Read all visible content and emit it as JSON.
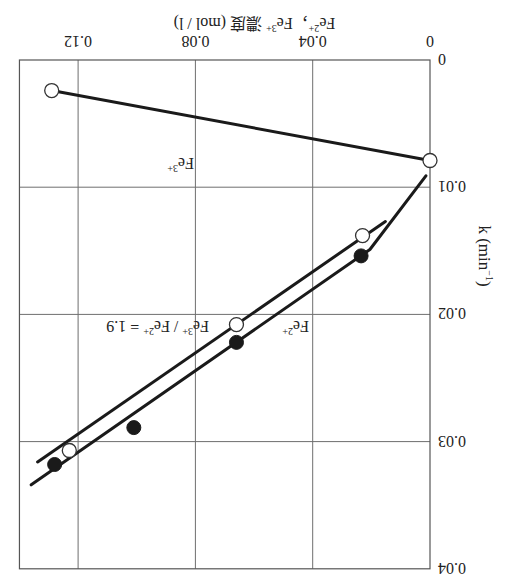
{
  "orientation": "rotated-180",
  "chart_data": {
    "type": "line",
    "title": "",
    "xlabel": "Fe2+, Fe3+ 濃度 (mol / l)",
    "ylabel": "k (min⁻¹)",
    "xlim": [
      0,
      0.14
    ],
    "ylim": [
      0,
      0.04
    ],
    "x_ticks": [
      "0",
      "0.04",
      "0.08",
      "0.12"
    ],
    "y_ticks": [
      "0",
      "0.01",
      "0.02",
      "0.03",
      "0.04"
    ],
    "grid": true,
    "series": [
      {
        "name": "Fe3+",
        "marker": "open-circle",
        "points": [
          [
            0,
            0.0079
          ],
          [
            0.129,
            0.0024
          ]
        ],
        "line": [
          [
            0,
            0.0079
          ],
          [
            0.129,
            0.0024
          ]
        ]
      },
      {
        "name": "Fe2+",
        "marker": "filled-circle",
        "points": [
          [
            0.0235,
            0.0154
          ],
          [
            0.066,
            0.0222
          ],
          [
            0.101,
            0.0289
          ],
          [
            0.128,
            0.0318
          ]
        ],
        "line": [
          [
            0.0014,
            0.0091
          ],
          [
            0.0205,
            0.0149
          ],
          [
            0.136,
            0.0334
          ]
        ]
      },
      {
        "name": "Fe3+ / Fe2+ = 1.9",
        "marker": "open-circle",
        "points": [
          [
            0.023,
            0.0138
          ],
          [
            0.066,
            0.0208
          ],
          [
            0.123,
            0.0307
          ]
        ],
        "line": [
          [
            0.0152,
            0.0127
          ],
          [
            0.1338,
            0.0316
          ]
        ]
      }
    ]
  },
  "labels": {
    "x_title_main": "Fe",
    "x_title_sup1": "2+",
    "x_title_sep": "，",
    "x_title_fe": "Fe",
    "x_title_sup2": "3+",
    "x_title_rest": " 濃度 (mol / l)",
    "y_title": "k (min",
    "y_title_sup": "−1",
    "y_title_close": ")",
    "fe3_label": "Fe",
    "fe3_sup": "3+",
    "fe2_label": "Fe",
    "fe2_sup": "2+",
    "ratio_label_a": "Fe",
    "ratio_sup_a": "3+",
    "ratio_mid": " / Fe",
    "ratio_sup_b": "2+",
    "ratio_tail": " = 1.9"
  }
}
